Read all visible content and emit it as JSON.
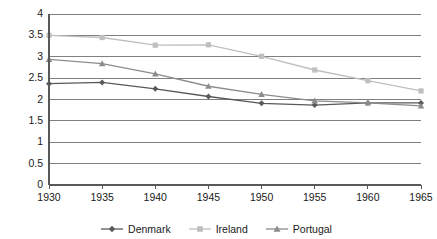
{
  "chart_data": {
    "type": "line",
    "title": "",
    "subtitle": "",
    "xlabel": "",
    "ylabel": "",
    "categories": [
      "1930",
      "1935",
      "1940",
      "1945",
      "1950",
      "1955",
      "1960",
      "1965"
    ],
    "x": [
      1930,
      1935,
      1940,
      1945,
      1950,
      1955,
      1960,
      1965
    ],
    "ylim": [
      0,
      4
    ],
    "xlim": [
      1930,
      1965
    ],
    "yticks": [
      "0",
      "0.5",
      "1",
      "1.5",
      "2",
      "2.5",
      "3",
      "3.5",
      "4"
    ],
    "ytick_values": [
      0,
      0.5,
      1,
      1.5,
      2,
      2.5,
      3,
      3.5,
      4
    ],
    "grid": "horizontal",
    "legend_position": "bottom",
    "series": [
      {
        "name": "Denmark",
        "color": "#595959",
        "marker": "diamond",
        "values": [
          2.37,
          2.4,
          2.25,
          2.07,
          1.91,
          1.87,
          1.92,
          1.92
        ]
      },
      {
        "name": "Ireland",
        "color": "#bfbfbf",
        "marker": "square",
        "values": [
          3.5,
          3.45,
          3.27,
          3.28,
          3.01,
          2.69,
          2.44,
          2.2
        ]
      },
      {
        "name": "Portugal",
        "color": "#8c8c8c",
        "marker": "triangle",
        "values": [
          2.94,
          2.84,
          2.6,
          2.31,
          2.12,
          1.97,
          1.92,
          1.85
        ]
      }
    ]
  },
  "legend": {
    "items": [
      {
        "label": "Denmark"
      },
      {
        "label": "Ireland"
      },
      {
        "label": "Portugal"
      }
    ]
  },
  "axis": {
    "y_labels": [
      "4",
      "3.5",
      "3",
      "2.5",
      "2",
      "1.5",
      "1",
      "0.5",
      "0"
    ],
    "x_labels": [
      "1930",
      "1935",
      "1940",
      "1945",
      "1950",
      "1955",
      "1960",
      "1965"
    ]
  },
  "colors": {
    "grid": "#808080",
    "axis": "#595959",
    "text": "#1a1a1a",
    "denmark": "#595959",
    "ireland": "#bfbfbf",
    "portugal": "#8c8c8c"
  }
}
